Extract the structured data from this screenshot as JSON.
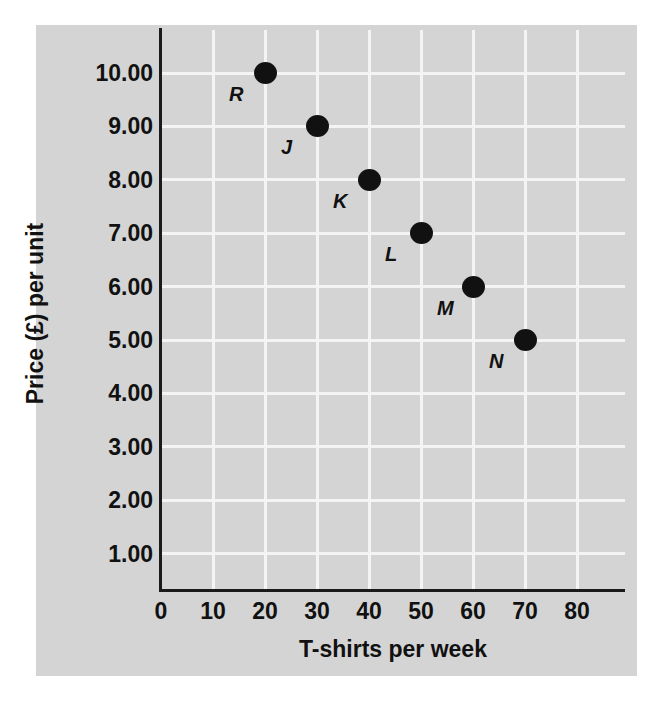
{
  "chart_data": {
    "type": "scatter",
    "title": "",
    "xlabel": "T-shirts per week",
    "ylabel": "Price (£) per unit",
    "xlim": [
      0,
      90
    ],
    "ylim": [
      0,
      10.6
    ],
    "xticks": [
      "0",
      "10",
      "20",
      "30",
      "40",
      "50",
      "60",
      "70",
      "80"
    ],
    "xtick_values": [
      0,
      10,
      20,
      30,
      40,
      50,
      60,
      70,
      80
    ],
    "yticks": [
      "1.00",
      "2.00",
      "3.00",
      "4.00",
      "5.00",
      "6.00",
      "7.00",
      "8.00",
      "9.00",
      "10.00"
    ],
    "ytick_values": [
      1,
      2,
      3,
      4,
      5,
      6,
      7,
      8,
      9,
      10
    ],
    "grid": true,
    "legend": "none",
    "points": [
      {
        "label": "R",
        "x": 20,
        "y": 10.0
      },
      {
        "label": "J",
        "x": 30,
        "y": 9.0
      },
      {
        "label": "K",
        "x": 40,
        "y": 8.0
      },
      {
        "label": "L",
        "x": 50,
        "y": 7.0
      },
      {
        "label": "M",
        "x": 60,
        "y": 6.0
      },
      {
        "label": "N",
        "x": 70,
        "y": 5.0
      }
    ]
  },
  "style": {
    "panel_background": "#d4d4d4",
    "grid_color": "#f4f4f4",
    "axis_color": "#1a1a1a",
    "marker_color": "#111111",
    "page_background": "#ffffff"
  }
}
